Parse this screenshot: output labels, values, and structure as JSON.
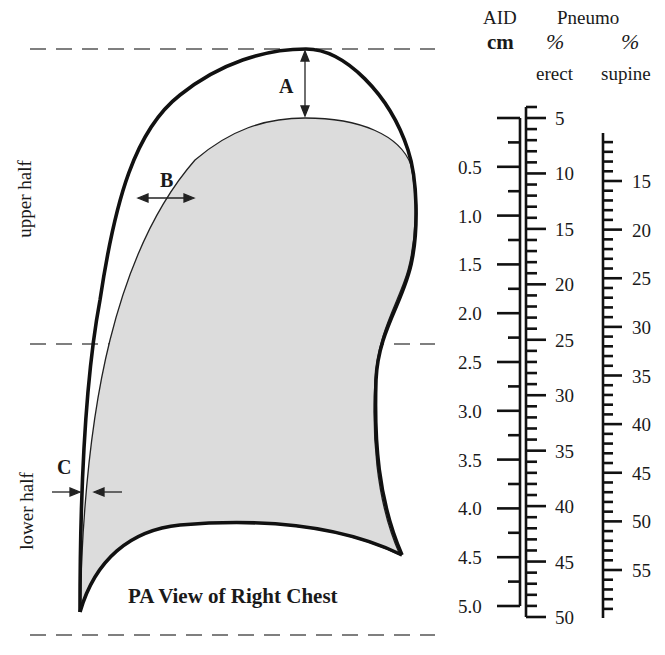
{
  "diagram": {
    "title": "PA View of Right Chest",
    "region_labels": {
      "upper": "upper half",
      "lower": "lower half"
    },
    "measurements": {
      "A": "A",
      "B": "B",
      "C": "C"
    },
    "colors": {
      "lung_fill": "#dcdcdc",
      "outline": "#111111",
      "dash": "#555555"
    }
  },
  "headers": {
    "aid": "AID",
    "pneumo": "Pneumo",
    "aid_unit": "cm",
    "erect_unit": "%",
    "supine_unit": "%",
    "erect_label": "erect",
    "supine_label": "supine"
  },
  "scales": {
    "aid_cm": {
      "labels": [
        "0.5",
        "1.0",
        "1.5",
        "2.0",
        "2.5",
        "3.0",
        "3.5",
        "4.0",
        "4.5",
        "5.0"
      ],
      "range": [
        0,
        5.0
      ],
      "major_step": 0.5,
      "minor_step": 0.25
    },
    "erect_pct": {
      "labels": [
        "5",
        "10",
        "15",
        "20",
        "25",
        "30",
        "35",
        "40",
        "45",
        "50"
      ],
      "range": [
        5,
        50
      ],
      "major_step": 5,
      "minor_step": 1
    },
    "supine_pct": {
      "labels": [
        "15",
        "20",
        "25",
        "30",
        "35",
        "40",
        "45",
        "50",
        "55"
      ],
      "range": [
        11,
        59
      ],
      "major_step": 5,
      "minor_step": 1
    }
  }
}
